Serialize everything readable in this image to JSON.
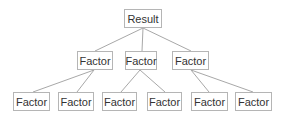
{
  "diagram": {
    "type": "tree",
    "colors": {
      "border": "#b5b5b5",
      "line": "#a8a8a8",
      "text": "#333333",
      "background": "#ffffff"
    },
    "root": {
      "label": "Result"
    },
    "level1": [
      {
        "label": "Factor"
      },
      {
        "label": "Factor"
      },
      {
        "label": "Factor"
      }
    ],
    "level2": [
      {
        "label": "Factor",
        "parent": 0
      },
      {
        "label": "Factor",
        "parent": 0
      },
      {
        "label": "Factor",
        "parent": 1
      },
      {
        "label": "Factor",
        "parent": 1
      },
      {
        "label": "Factor",
        "parent": 2
      },
      {
        "label": "Factor",
        "parent": 2
      }
    ]
  }
}
